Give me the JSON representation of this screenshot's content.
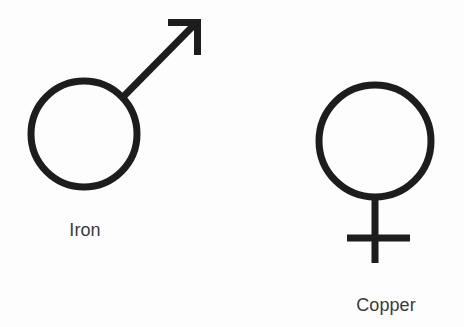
{
  "figure": {
    "background_color": "#fdfdfd",
    "stroke_color": "#1d1d1d",
    "text_color": "#3a3a3a",
    "width": 464,
    "height": 327,
    "symbols": [
      {
        "id": "mars-iron",
        "icon_name": "mars-symbol-icon",
        "label": "Iron",
        "planet": "Mars",
        "glyph": "♂",
        "stroke_width": 7,
        "circle": {
          "cx": 84,
          "cy": 134,
          "r": 53
        },
        "arrow": {
          "from_x": 125,
          "from_y": 95,
          "to_x": 197,
          "to_y": 22,
          "barb_horizontal_x": 168,
          "barb_vertical_y": 55
        },
        "label_position": {
          "x": 85,
          "y": 236
        }
      },
      {
        "id": "venus-copper",
        "icon_name": "venus-symbol-icon",
        "label": "Copper",
        "planet": "Venus",
        "glyph": "♀",
        "stroke_width": 7,
        "circle": {
          "cx": 375,
          "cy": 141,
          "r": 56
        },
        "stem": {
          "x": 375,
          "y_top": 197,
          "y_bottom": 263
        },
        "crossbar": {
          "y": 238,
          "x_left": 347,
          "x_right": 410
        },
        "label_position": {
          "x": 386,
          "y": 311
        }
      }
    ]
  }
}
